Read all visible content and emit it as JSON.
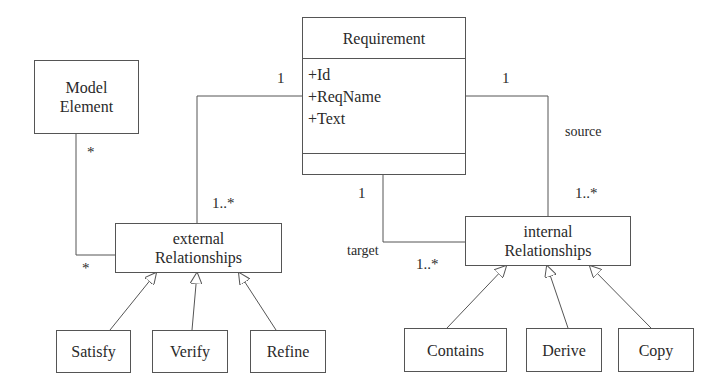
{
  "diagram": {
    "type": "UML class diagram",
    "requirement_class": {
      "name": "Requirement",
      "attributes": [
        "+Id",
        "+ReqName",
        "+Text"
      ],
      "operations": []
    },
    "model_element": {
      "line1": "Model",
      "line2": "Element"
    },
    "external_relationships": {
      "line1": "external",
      "line2": "Relationships"
    },
    "internal_relationships": {
      "line1": "internal",
      "line2": "Relationships"
    },
    "external_subtypes": [
      "Satisfy",
      "Verify",
      "Refine"
    ],
    "internal_subtypes": [
      "Contains",
      "Derive",
      "Copy"
    ],
    "multiplicities": {
      "req_to_external_req_end": "1",
      "req_to_external_rel_end": "1..*",
      "model_element_end": "*",
      "model_element_rel_end": "*",
      "source_req_end": "1",
      "source_rel_end": "1..*",
      "target_req_end": "1",
      "target_rel_end": "1..*"
    },
    "role_labels": {
      "source": "source",
      "target": "target"
    }
  }
}
